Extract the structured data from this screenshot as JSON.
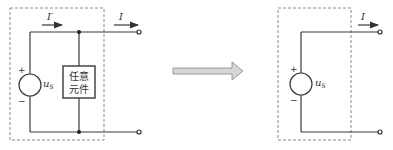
{
  "left_circuit": {
    "current_inner_label": "I′",
    "current_outer_label": "I",
    "source_label": "u",
    "source_subscript": "S",
    "plus_sign": "+",
    "minus_sign": "−",
    "element_line1": "任意",
    "element_line2": "元件"
  },
  "transform_arrow": {
    "direction": "right",
    "fill_color": "#d6d6d6"
  },
  "right_circuit": {
    "current_outer_label": "I",
    "source_label": "u",
    "source_subscript": "S",
    "plus_sign": "+",
    "minus_sign": "−"
  }
}
